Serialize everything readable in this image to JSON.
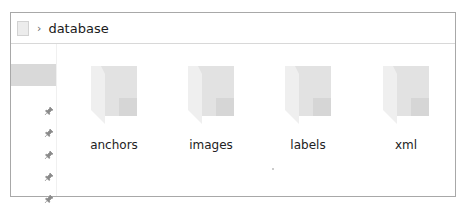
{
  "address_bar": {
    "location_icon": "folder-location-icon",
    "separator": "›",
    "breadcrumb": [
      "database"
    ]
  },
  "nav_pane": {
    "selected_item": "",
    "pinned_items": [
      {
        "icon": "pin-icon"
      },
      {
        "icon": "pin-icon"
      },
      {
        "icon": "pin-icon"
      },
      {
        "icon": "pin-icon"
      },
      {
        "icon": "pin-icon"
      }
    ]
  },
  "content": {
    "items": [
      {
        "label": "anchors",
        "type": "folder",
        "icon": "folder-icon"
      },
      {
        "label": "images",
        "type": "folder",
        "icon": "folder-icon"
      },
      {
        "label": "labels",
        "type": "folder",
        "icon": "folder-icon"
      },
      {
        "label": "xml",
        "type": "folder",
        "icon": "folder-icon"
      }
    ]
  }
}
